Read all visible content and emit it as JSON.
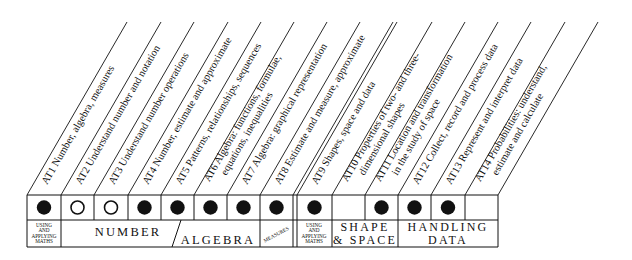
{
  "colors": {
    "ink": "#111111",
    "background": "#ffffff"
  },
  "attainment_targets": [
    {
      "code": "AT1",
      "lines": [
        "AT1  Number, algebra, measures"
      ],
      "marker": "filled"
    },
    {
      "code": "AT2",
      "lines": [
        "AT2  Understand number and notation"
      ],
      "marker": "open"
    },
    {
      "code": "AT3",
      "lines": [
        "AT3  Understand number operations"
      ],
      "marker": "open"
    },
    {
      "code": "AT4",
      "lines": [
        "AT4  Number, estimate and approximate"
      ],
      "marker": "filled"
    },
    {
      "code": "AT5",
      "lines": [
        "AT5  Patterns, relationships, sequences"
      ],
      "marker": "filled"
    },
    {
      "code": "AT6",
      "lines": [
        "AT6  Algebra: functions, formulae,",
        "equations, inequalities"
      ],
      "marker": "filled"
    },
    {
      "code": "AT7",
      "lines": [
        "AT7  Algebra: graphical representation"
      ],
      "marker": "filled"
    },
    {
      "code": "AT8",
      "lines": [
        "AT8  Estimate and measure, approximate"
      ],
      "marker": "filled"
    },
    {
      "code": "AT9",
      "lines": [
        "AT9  Shapes, space and data"
      ],
      "marker": "filled"
    },
    {
      "code": "AT10",
      "lines": [
        "AT10  Properties of two- and three-",
        "dimensional shapes"
      ],
      "marker": "none"
    },
    {
      "code": "AT11",
      "lines": [
        "AT11  Location and transformation",
        "in the study of space"
      ],
      "marker": "filled"
    },
    {
      "code": "AT12",
      "lines": [
        "AT12  Collect, record and process data"
      ],
      "marker": "filled"
    },
    {
      "code": "AT13",
      "lines": [
        "AT13  Represent and interpret data"
      ],
      "marker": "filled"
    },
    {
      "code": "AT14",
      "lines": [
        "AT14  Probabilities: understand,",
        "estimate and calculate"
      ],
      "marker": "none"
    }
  ],
  "groups": [
    {
      "name": "using-applying-1",
      "lines": [
        "USING",
        "AND",
        "APPLYING",
        "MATHS"
      ],
      "style": "tiny"
    },
    {
      "name": "number",
      "lines": [
        "NUMBER"
      ],
      "style": "big"
    },
    {
      "name": "algebra",
      "lines": [
        "ALGEBRA"
      ],
      "style": "big"
    },
    {
      "name": "measures",
      "lines": [
        "MEASURES"
      ],
      "style": "slant"
    },
    {
      "name": "using-applying-2",
      "lines": [
        "USING",
        "AND",
        "APPLYING",
        "MATHS"
      ],
      "style": "tiny"
    },
    {
      "name": "shape-space",
      "lines": [
        "SHAPE",
        "& SPACE"
      ],
      "style": "big"
    },
    {
      "name": "handling-data",
      "lines": [
        "HANDLING",
        "DATA"
      ],
      "style": "big"
    }
  ]
}
